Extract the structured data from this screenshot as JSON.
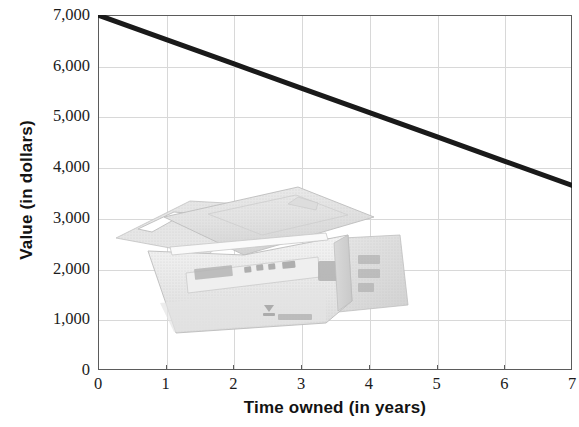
{
  "chart_data": {
    "type": "line",
    "title": "",
    "xlabel": "Time owned (in years)",
    "ylabel": "Value (in dollars)",
    "xlim": [
      0,
      7
    ],
    "ylim": [
      0,
      7000
    ],
    "xticks": [
      "0",
      "1",
      "2",
      "3",
      "4",
      "5",
      "6",
      "7"
    ],
    "xtick_values": [
      0,
      1,
      2,
      3,
      4,
      5,
      6,
      7
    ],
    "yticks": [
      "0",
      "1,000",
      "2,000",
      "3,000",
      "4,000",
      "5,000",
      "6,000",
      "7,000"
    ],
    "ytick_values": [
      0,
      1000,
      2000,
      3000,
      4000,
      5000,
      6000,
      7000
    ],
    "grid": true,
    "legend": "none",
    "series": [
      {
        "name": "Value of printer",
        "color": "#1a1a1a",
        "line_width": 5,
        "x": [
          0,
          1,
          2,
          3,
          4,
          5,
          6,
          7
        ],
        "values": [
          7000,
          6520,
          6040,
          5560,
          5080,
          4600,
          4120,
          3640
        ]
      }
    ],
    "annotations": [
      {
        "type": "image",
        "name": "dot-matrix-printer-photo",
        "description": "Grayscale photograph of a dot-matrix printer with paper tray",
        "x_range": [
          0.2,
          4.5
        ],
        "y_range": [
          700,
          3400
        ]
      }
    ]
  },
  "axes": {
    "y_title": "Value (in dollars)",
    "x_title": "Time owned (in years)"
  },
  "colors": {
    "line": "#1a1a1a",
    "grid": "#d8d8d8",
    "frame": "#5b5b5b",
    "text": "#131313",
    "background": "#ffffff"
  }
}
